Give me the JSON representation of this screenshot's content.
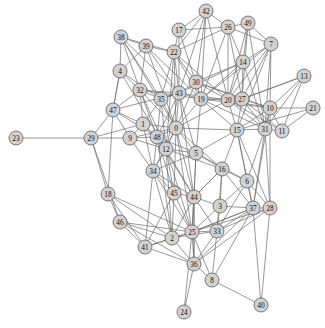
{
  "figure": {
    "kind": "network-graph",
    "title": "",
    "width": 325,
    "height": 328,
    "background_color": "#ffffff"
  },
  "style": {
    "node_fill": "#d2d2d2",
    "node_stroke": "#5a5a5a",
    "node_radius": 7,
    "edge_color": "#6b6b6b",
    "edge_width": 0.7,
    "label_color": "#111111",
    "label_size": 7.4
  },
  "chart_data": {
    "type": "scatter",
    "title": "",
    "xlabel": "",
    "ylabel": "",
    "grid": false,
    "legend": "none",
    "node_count": 50,
    "edge_count": 185,
    "nodes": [
      {
        "id": 0,
        "label": "0",
        "x": 176,
        "y": 128
      },
      {
        "id": 1,
        "label": "1",
        "x": 143,
        "y": 124
      },
      {
        "id": 2,
        "label": "2",
        "x": 172,
        "y": 238
      },
      {
        "id": 3,
        "label": "3",
        "x": 220,
        "y": 206
      },
      {
        "id": 4,
        "label": "4",
        "x": 120,
        "y": 71
      },
      {
        "id": 5,
        "label": "5",
        "x": 196,
        "y": 153
      },
      {
        "id": 6,
        "label": "6",
        "x": 247,
        "y": 181
      },
      {
        "id": 7,
        "label": "7",
        "x": 271,
        "y": 44
      },
      {
        "id": 8,
        "label": "8",
        "x": 212,
        "y": 280
      },
      {
        "id": 9,
        "label": "9",
        "x": 130,
        "y": 138
      },
      {
        "id": 10,
        "label": "10",
        "x": 270,
        "y": 108
      },
      {
        "id": 11,
        "label": "11",
        "x": 282,
        "y": 131
      },
      {
        "id": 12,
        "label": "12",
        "x": 166,
        "y": 149
      },
      {
        "id": 13,
        "label": "13",
        "x": 304,
        "y": 76
      },
      {
        "id": 14,
        "label": "14",
        "x": 243,
        "y": 62
      },
      {
        "id": 15,
        "label": "15",
        "x": 237,
        "y": 130
      },
      {
        "id": 16,
        "label": "16",
        "x": 222,
        "y": 169
      },
      {
        "id": 17,
        "label": "17",
        "x": 179,
        "y": 30
      },
      {
        "id": 18,
        "label": "18",
        "x": 108,
        "y": 194
      },
      {
        "id": 19,
        "label": "19",
        "x": 201,
        "y": 99
      },
      {
        "id": 20,
        "label": "20",
        "x": 228,
        "y": 100
      },
      {
        "id": 21,
        "label": "21",
        "x": 313,
        "y": 108
      },
      {
        "id": 22,
        "label": "22",
        "x": 174,
        "y": 52
      },
      {
        "id": 23,
        "label": "23",
        "x": 16,
        "y": 138
      },
      {
        "id": 24,
        "label": "24",
        "x": 184,
        "y": 312
      },
      {
        "id": 25,
        "label": "25",
        "x": 192,
        "y": 232
      },
      {
        "id": 26,
        "label": "26",
        "x": 228,
        "y": 27
      },
      {
        "id": 27,
        "label": "27",
        "x": 242,
        "y": 99
      },
      {
        "id": 28,
        "label": "28",
        "x": 270,
        "y": 208
      },
      {
        "id": 29,
        "label": "29",
        "x": 91,
        "y": 138
      },
      {
        "id": 30,
        "label": "30",
        "x": 196,
        "y": 82
      },
      {
        "id": 31,
        "label": "31",
        "x": 265,
        "y": 129
      },
      {
        "id": 32,
        "label": "32",
        "x": 140,
        "y": 90
      },
      {
        "id": 33,
        "label": "33",
        "x": 217,
        "y": 231
      },
      {
        "id": 34,
        "label": "34",
        "x": 153,
        "y": 171
      },
      {
        "id": 35,
        "label": "35",
        "x": 161,
        "y": 99
      },
      {
        "id": 36,
        "label": "36",
        "x": 194,
        "y": 264
      },
      {
        "id": 37,
        "label": "37",
        "x": 253,
        "y": 208
      },
      {
        "id": 38,
        "label": "38",
        "x": 121,
        "y": 37
      },
      {
        "id": 39,
        "label": "39",
        "x": 146,
        "y": 46
      },
      {
        "id": 40,
        "label": "40",
        "x": 261,
        "y": 305
      },
      {
        "id": 41,
        "label": "41",
        "x": 145,
        "y": 247
      },
      {
        "id": 42,
        "label": "42",
        "x": 206,
        "y": 11
      },
      {
        "id": 43,
        "label": "43",
        "x": 179,
        "y": 93
      },
      {
        "id": 44,
        "label": "44",
        "x": 194,
        "y": 197
      },
      {
        "id": 45,
        "label": "45",
        "x": 174,
        "y": 193
      },
      {
        "id": 46,
        "label": "46",
        "x": 120,
        "y": 222
      },
      {
        "id": 47,
        "label": "47",
        "x": 113,
        "y": 110
      },
      {
        "id": 48,
        "label": "48",
        "x": 157,
        "y": 137
      },
      {
        "id": 49,
        "label": "49",
        "x": 248,
        "y": 23
      }
    ],
    "edges": [
      [
        23,
        29
      ],
      [
        29,
        47
      ],
      [
        29,
        9
      ],
      [
        29,
        18
      ],
      [
        29,
        1
      ],
      [
        29,
        46
      ],
      [
        47,
        4
      ],
      [
        47,
        32
      ],
      [
        47,
        1
      ],
      [
        47,
        9
      ],
      [
        47,
        48
      ],
      [
        47,
        18
      ],
      [
        47,
        43
      ],
      [
        4,
        32
      ],
      [
        4,
        38
      ],
      [
        4,
        39
      ],
      [
        4,
        47
      ],
      [
        4,
        12
      ],
      [
        4,
        35
      ],
      [
        38,
        32
      ],
      [
        38,
        39
      ],
      [
        38,
        22
      ],
      [
        38,
        43
      ],
      [
        38,
        35
      ],
      [
        38,
        0
      ],
      [
        39,
        22
      ],
      [
        39,
        32
      ],
      [
        39,
        43
      ],
      [
        39,
        0
      ],
      [
        39,
        19
      ],
      [
        32,
        35
      ],
      [
        32,
        43
      ],
      [
        32,
        1
      ],
      [
        32,
        0
      ],
      [
        32,
        48
      ],
      [
        32,
        12
      ],
      [
        32,
        19
      ],
      [
        17,
        22
      ],
      [
        17,
        42
      ],
      [
        17,
        26
      ],
      [
        17,
        43
      ],
      [
        17,
        19
      ],
      [
        42,
        26
      ],
      [
        42,
        22
      ],
      [
        42,
        19
      ],
      [
        42,
        43
      ],
      [
        42,
        30
      ],
      [
        42,
        20
      ],
      [
        26,
        49
      ],
      [
        26,
        7
      ],
      [
        26,
        14
      ],
      [
        26,
        20
      ],
      [
        26,
        27
      ],
      [
        26,
        19
      ],
      [
        26,
        22
      ],
      [
        49,
        7
      ],
      [
        49,
        14
      ],
      [
        49,
        27
      ],
      [
        49,
        20
      ],
      [
        49,
        31
      ],
      [
        7,
        10
      ],
      [
        7,
        14
      ],
      [
        7,
        27
      ],
      [
        7,
        20
      ],
      [
        7,
        31
      ],
      [
        7,
        15
      ],
      [
        7,
        19
      ],
      [
        14,
        27
      ],
      [
        14,
        20
      ],
      [
        14,
        43
      ],
      [
        14,
        19
      ],
      [
        14,
        31
      ],
      [
        14,
        30
      ],
      [
        22,
        43
      ],
      [
        22,
        30
      ],
      [
        22,
        19
      ],
      [
        22,
        35
      ],
      [
        22,
        0
      ],
      [
        22,
        12
      ],
      [
        22,
        20
      ],
      [
        30,
        43
      ],
      [
        30,
        19
      ],
      [
        30,
        20
      ],
      [
        30,
        27
      ],
      [
        30,
        0
      ],
      [
        30,
        10
      ],
      [
        43,
        19
      ],
      [
        43,
        35
      ],
      [
        43,
        0
      ],
      [
        43,
        12
      ],
      [
        43,
        48
      ],
      [
        43,
        5
      ],
      [
        43,
        20
      ],
      [
        43,
        44
      ],
      [
        35,
        0
      ],
      [
        35,
        12
      ],
      [
        35,
        48
      ],
      [
        35,
        1
      ],
      [
        35,
        43
      ],
      [
        19,
        20
      ],
      [
        19,
        27
      ],
      [
        19,
        0
      ],
      [
        19,
        15
      ],
      [
        19,
        5
      ],
      [
        19,
        10
      ],
      [
        19,
        31
      ],
      [
        20,
        27
      ],
      [
        20,
        10
      ],
      [
        20,
        15
      ],
      [
        20,
        0
      ],
      [
        20,
        31
      ],
      [
        20,
        11
      ],
      [
        27,
        10
      ],
      [
        27,
        31
      ],
      [
        27,
        15
      ],
      [
        27,
        11
      ],
      [
        27,
        13
      ],
      [
        13,
        10
      ],
      [
        13,
        31
      ],
      [
        13,
        11
      ],
      [
        13,
        27
      ],
      [
        10,
        21
      ],
      [
        10,
        11
      ],
      [
        10,
        31
      ],
      [
        10,
        15
      ],
      [
        10,
        28
      ],
      [
        10,
        37
      ],
      [
        21,
        11
      ],
      [
        21,
        15
      ],
      [
        31,
        11
      ],
      [
        31,
        15
      ],
      [
        31,
        28
      ],
      [
        31,
        37
      ],
      [
        31,
        6
      ],
      [
        15,
        0
      ],
      [
        15,
        5
      ],
      [
        15,
        16
      ],
      [
        15,
        6
      ],
      [
        15,
        28
      ],
      [
        15,
        37
      ],
      [
        1,
        0
      ],
      [
        1,
        48
      ],
      [
        1,
        9
      ],
      [
        1,
        12
      ],
      [
        1,
        34
      ],
      [
        9,
        48
      ],
      [
        9,
        12
      ],
      [
        9,
        0
      ],
      [
        9,
        34
      ],
      [
        0,
        48
      ],
      [
        0,
        12
      ],
      [
        0,
        5
      ],
      [
        0,
        44
      ],
      [
        0,
        34
      ],
      [
        0,
        16
      ],
      [
        0,
        25
      ],
      [
        0,
        45
      ],
      [
        48,
        12
      ],
      [
        48,
        34
      ],
      [
        48,
        5
      ],
      [
        48,
        44
      ],
      [
        48,
        45
      ],
      [
        48,
        2
      ],
      [
        12,
        5
      ],
      [
        12,
        34
      ],
      [
        12,
        44
      ],
      [
        12,
        45
      ],
      [
        12,
        25
      ],
      [
        12,
        2
      ],
      [
        12,
        16
      ],
      [
        5,
        44
      ],
      [
        5,
        16
      ],
      [
        5,
        25
      ],
      [
        5,
        6
      ],
      [
        5,
        34
      ],
      [
        16,
        6
      ],
      [
        16,
        3
      ],
      [
        16,
        44
      ],
      [
        16,
        37
      ],
      [
        16,
        33
      ],
      [
        6,
        3
      ],
      [
        6,
        37
      ],
      [
        6,
        28
      ],
      [
        6,
        33
      ],
      [
        34,
        45
      ],
      [
        34,
        44
      ],
      [
        34,
        25
      ],
      [
        34,
        2
      ],
      [
        34,
        41
      ],
      [
        45,
        44
      ],
      [
        45,
        25
      ],
      [
        45,
        2
      ],
      [
        45,
        41
      ],
      [
        44,
        25
      ],
      [
        44,
        3
      ],
      [
        44,
        33
      ],
      [
        44,
        36
      ],
      [
        44,
        2
      ],
      [
        44,
        16
      ],
      [
        3,
        33
      ],
      [
        3,
        37
      ],
      [
        3,
        25
      ],
      [
        18,
        46
      ],
      [
        18,
        41
      ],
      [
        18,
        2
      ],
      [
        18,
        25
      ],
      [
        46,
        41
      ],
      [
        46,
        2
      ],
      [
        46,
        25
      ],
      [
        46,
        36
      ],
      [
        41,
        2
      ],
      [
        41,
        36
      ],
      [
        41,
        25
      ],
      [
        2,
        25
      ],
      [
        2,
        36
      ],
      [
        2,
        33
      ],
      [
        25,
        33
      ],
      [
        25,
        36
      ],
      [
        25,
        37
      ],
      [
        25,
        8
      ],
      [
        25,
        28
      ],
      [
        25,
        24
      ],
      [
        33,
        37
      ],
      [
        33,
        36
      ],
      [
        33,
        8
      ],
      [
        33,
        28
      ],
      [
        37,
        28
      ],
      [
        37,
        36
      ],
      [
        37,
        8
      ],
      [
        37,
        40
      ],
      [
        37,
        25
      ],
      [
        28,
        40
      ],
      [
        28,
        36
      ],
      [
        36,
        8
      ],
      [
        36,
        24
      ],
      [
        36,
        44
      ],
      [
        8,
        40
      ]
    ]
  }
}
